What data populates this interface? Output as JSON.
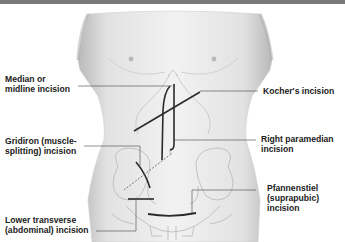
{
  "figure": {
    "type": "anatomical illustration"
  },
  "labels": {
    "median": {
      "line1": "Median or",
      "line2": "midline incision"
    },
    "gridiron": {
      "line1": "Gridiron (muscle-",
      "line2": "splitting) incision"
    },
    "lower_transverse": {
      "line1": "Lower transverse",
      "line2": "(abdominal) incision"
    },
    "kocher": {
      "line1": "Kocher's incision"
    },
    "paramedian": {
      "line1": "Right paramedian",
      "line2": "incision"
    },
    "pfannenstiel": {
      "line1": "Pfannenstiel",
      "line2": "(suprapubic)",
      "line3": "incision"
    }
  },
  "colors": {
    "topbar": "#7a7a7a",
    "skin": "#e6e6e6",
    "incision": "#2a2a2a",
    "leader": "#444444"
  }
}
